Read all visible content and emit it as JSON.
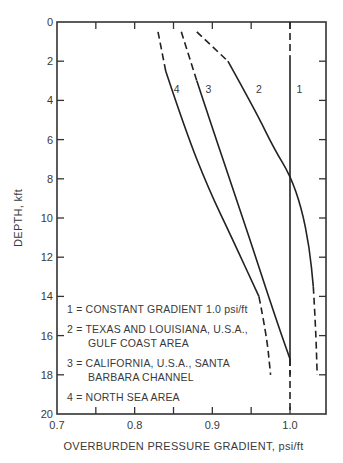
{
  "chart_data": {
    "type": "line",
    "title": "",
    "xlabel": "OVERBURDEN PRESSURE GRADIENT, psi/ft",
    "ylabel": "DEPTH, kft",
    "xlim": [
      0.7,
      1.05
    ],
    "ylim": [
      20,
      0
    ],
    "y_inverted": true,
    "x_ticks": [
      0.7,
      0.8,
      0.9,
      1.0
    ],
    "x_tick_labels": [
      "0.7",
      "0.8",
      "0.9",
      "1.0"
    ],
    "x_minor_ticks": [
      0.75,
      0.85,
      0.95
    ],
    "y_ticks": [
      0,
      2,
      4,
      6,
      8,
      10,
      12,
      14,
      16,
      18,
      20
    ],
    "y_tick_labels": [
      "0",
      "2",
      "4",
      "6",
      "8",
      "10",
      "12",
      "14",
      "16",
      "18",
      "20"
    ],
    "grid": false,
    "legend_position": "lower-left inside",
    "series": [
      {
        "name": "1",
        "label": "1 = CONSTANT GRADIENT 1.0 psi/ft",
        "points": [
          [
            1.0,
            0
          ],
          [
            1.0,
            1.7
          ],
          [
            1.0,
            17.2
          ],
          [
            1.0,
            20
          ]
        ],
        "dashed_segments": [
          [
            0,
            1.7
          ],
          [
            17.2,
            20
          ]
        ]
      },
      {
        "name": "2",
        "label": "2 = TEXAS AND LOUISIANA, U.S.A., GULF COAST AREA",
        "points": [
          [
            0.88,
            0.5
          ],
          [
            0.92,
            2.0
          ],
          [
            0.955,
            4.5
          ],
          [
            0.98,
            6.5
          ],
          [
            1.0,
            7.8
          ],
          [
            1.015,
            9.5
          ],
          [
            1.025,
            11.5
          ],
          [
            1.03,
            13.5
          ],
          [
            1.033,
            15.5
          ],
          [
            1.035,
            18.0
          ]
        ],
        "dashed_segments": [
          [
            0.5,
            2.0
          ],
          [
            13.5,
            18.0
          ]
        ]
      },
      {
        "name": "3",
        "label": "3 = CALIFORNIA, U.S.A., SANTA BARBARA CHANNEL",
        "points": [
          [
            0.86,
            0.5
          ],
          [
            0.88,
            3.0
          ],
          [
            0.905,
            6.0
          ],
          [
            0.935,
            9.5
          ],
          [
            0.96,
            12.5
          ],
          [
            0.985,
            15.5
          ],
          [
            1.0,
            17.2
          ],
          [
            1.0,
            18.0
          ]
        ],
        "dashed_segments": [
          [
            0.5,
            3.0
          ],
          [
            17.2,
            18.0
          ]
        ]
      },
      {
        "name": "4",
        "label": "4 = NORTH SEA AREA",
        "points": [
          [
            0.83,
            0.5
          ],
          [
            0.84,
            2.5
          ],
          [
            0.865,
            5.5
          ],
          [
            0.895,
            8.5
          ],
          [
            0.925,
            11.0
          ],
          [
            0.96,
            14.0
          ],
          [
            0.97,
            16.0
          ],
          [
            0.975,
            18.0
          ]
        ],
        "dashed_segments": [
          [
            0.5,
            2.5
          ],
          [
            14.0,
            18.0
          ]
        ]
      }
    ],
    "annotations": [
      {
        "text": "1",
        "x": 1.012,
        "y": 3.4
      },
      {
        "text": "2",
        "x": 0.96,
        "y": 3.4
      },
      {
        "text": "3",
        "x": 0.895,
        "y": 3.4
      },
      {
        "text": "4",
        "x": 0.854,
        "y": 3.4
      }
    ]
  },
  "legend": {
    "line1": "1 = CONSTANT GRADIENT 1.0 psi/ft",
    "line2a": "2 = TEXAS AND LOUISIANA, U.S.A.,",
    "line2b": "GULF COAST AREA",
    "line3a": "3 = CALIFORNIA, U.S.A., SANTA",
    "line3b": "BARBARA CHANNEL",
    "line4": "4 = NORTH SEA AREA"
  }
}
